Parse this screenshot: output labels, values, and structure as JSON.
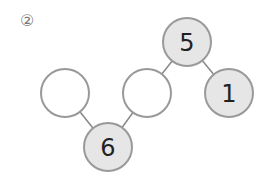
{
  "problem_label": "②",
  "colors": {
    "line": "#888888",
    "filled": "#e6e6e6",
    "empty": "#ffffff",
    "stroke": "#999999"
  },
  "nodes": [
    {
      "id": "top",
      "value": "5",
      "cx": 187,
      "cy": 42,
      "filled": true
    },
    {
      "id": "right",
      "value": "1",
      "cx": 229,
      "cy": 93,
      "filled": true
    },
    {
      "id": "mid-empty",
      "value": "",
      "cx": 147,
      "cy": 93,
      "filled": false
    },
    {
      "id": "left-empty",
      "value": "",
      "cx": 65,
      "cy": 93,
      "filled": false
    },
    {
      "id": "bottom",
      "value": "6",
      "cx": 108,
      "cy": 147,
      "filled": true
    }
  ]
}
